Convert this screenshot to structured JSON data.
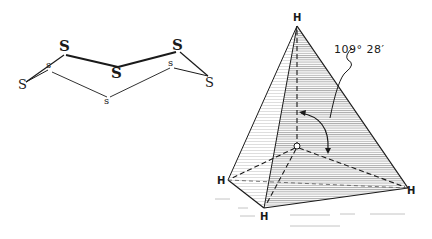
{
  "s8_ring": {
    "atoms": [
      {
        "label": "S",
        "size": "big"
      },
      {
        "label": "s",
        "size": "small"
      },
      {
        "label": "S",
        "size": "med"
      },
      {
        "label": "S",
        "size": "big"
      },
      {
        "label": "S",
        "size": "big"
      },
      {
        "label": "s",
        "size": "small"
      },
      {
        "label": "S",
        "size": "med"
      },
      {
        "label": "s",
        "size": "small"
      }
    ]
  },
  "tetrahedron": {
    "apex": "H",
    "left": "H",
    "bottom": "H",
    "right": "H",
    "center": "C",
    "angle_label": "109° 28′"
  },
  "colors": {
    "ink": "#1a1a1a",
    "hatch": "#8a8a8a",
    "background": "#ffffff"
  }
}
